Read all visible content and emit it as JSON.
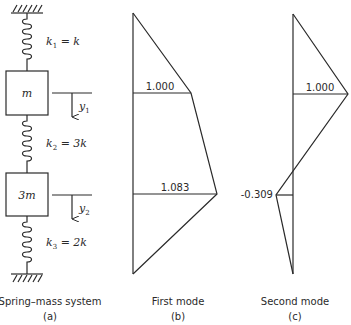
{
  "panels": {
    "a": {
      "caption": "Spring–mass system",
      "sublabel": "(a)",
      "springs": [
        {
          "label_k": "k",
          "sub": "1",
          "rhs": " = k"
        },
        {
          "label_k": "k",
          "sub": "2",
          "rhs": " = 3k"
        },
        {
          "label_k": "k",
          "sub": "3",
          "rhs": " = 2k"
        }
      ],
      "masses": [
        {
          "label": "m"
        },
        {
          "label": "3m"
        }
      ],
      "displacements": [
        {
          "label": "y",
          "sub": "1"
        },
        {
          "label": "y",
          "sub": "2"
        }
      ]
    },
    "b": {
      "caption": "First mode",
      "sublabel": "(b)",
      "values": [
        "1.000",
        "1.083"
      ]
    },
    "c": {
      "caption": "Second mode",
      "sublabel": "(c)",
      "values": [
        "1.000",
        "-0.309"
      ]
    }
  },
  "colors": {
    "ink": "#2a2a2a",
    "background": "#ffffff"
  }
}
